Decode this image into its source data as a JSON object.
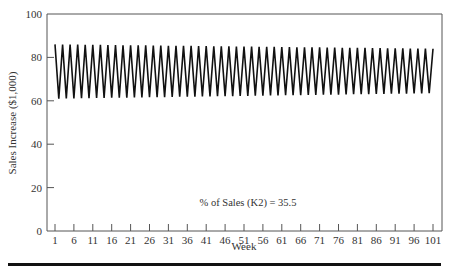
{
  "chart_data": {
    "type": "line",
    "title": "",
    "xlabel": "Week",
    "ylabel": "Sales Increase ($1,000)",
    "ylim": [
      0,
      100
    ],
    "xlim": [
      1,
      101
    ],
    "yticks": [
      0,
      20,
      40,
      60,
      80,
      100
    ],
    "xticks": [
      1,
      6,
      11,
      16,
      21,
      26,
      31,
      36,
      41,
      46,
      51,
      56,
      61,
      66,
      71,
      76,
      81,
      86,
      91,
      96,
      101
    ],
    "grid": false,
    "legend": null,
    "annotation": "% of Sales (K2) = 35.5",
    "series": [
      {
        "name": "Sales Increase",
        "description": "Alternating week-to-week oscillation; peaks decay from ~86 to ~84, troughs rise from ~61 to ~63.5",
        "peak_start": 86,
        "peak_end": 84,
        "trough_start": 61,
        "trough_end": 63.5,
        "weeks": 101
      }
    ]
  },
  "labels": {
    "xlabel": "Week",
    "ylabel": "Sales Increase ($1,000)",
    "annotation": "% of Sales (K2) = 35.5"
  }
}
